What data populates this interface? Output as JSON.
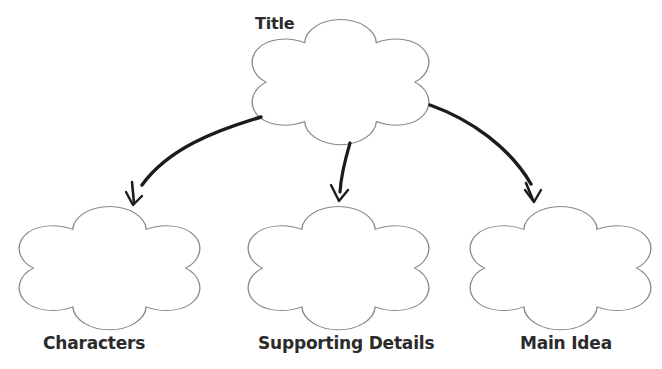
{
  "document": {
    "type": "graphic-organizer",
    "shape_name": "five-lobe-flower",
    "background_color": "#ffffff",
    "outline_color": "#8a8a8a",
    "arrow_color": "#1c1c1c",
    "text_color": "#2b2b2b"
  },
  "nodes": {
    "title": {
      "label": "Title"
    },
    "characters": {
      "label": "Characters"
    },
    "supporting_details": {
      "label": "Supporting Details"
    },
    "main_idea": {
      "label": "Main Idea"
    }
  },
  "connections": [
    {
      "name": "title-to-characters",
      "from": "title",
      "to": "characters",
      "style": "curved-arrow"
    },
    {
      "name": "title-to-supporting-details",
      "from": "title",
      "to": "supporting_details",
      "style": "straight-arrow"
    },
    {
      "name": "title-to-main-idea",
      "from": "title",
      "to": "main_idea",
      "style": "curved-arrow"
    }
  ]
}
